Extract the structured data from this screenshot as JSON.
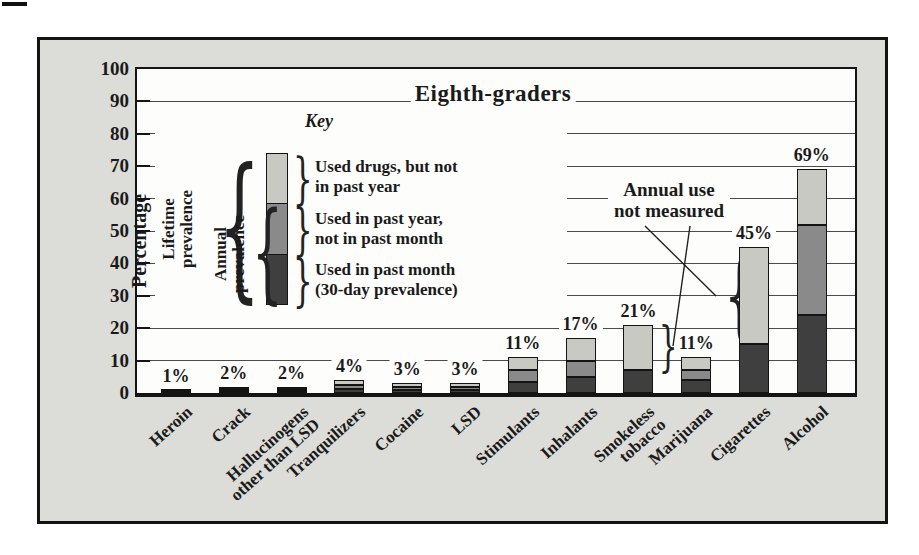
{
  "figure": {
    "title": "Eighth-graders",
    "y_axis_title": "Percentage",
    "key": {
      "heading": "Key",
      "items": [
        {
          "id": "lifetime-only",
          "label": "Used drugs, but not\nin past year",
          "color": "#c9c9c4"
        },
        {
          "id": "annual-only",
          "label": "Used in past year,\nnot in past month",
          "color": "#8a8a8a"
        },
        {
          "id": "past-month",
          "label": "Used in past month\n(30-day prevalence)",
          "color": "#3f3f3f"
        }
      ],
      "brackets": [
        {
          "id": "lifetime-prevalence",
          "label": "Lifetime\nprevalence"
        },
        {
          "id": "annual-prevalence",
          "label": "Annual\nprevalence"
        }
      ]
    },
    "annotation": "Annual use\nnot measured"
  },
  "chart_data": {
    "type": "bar",
    "stacked": true,
    "title": "Eighth-graders",
    "ylabel": "Percentage",
    "ylim": [
      0,
      100
    ],
    "ytick_interval": 10,
    "grid": true,
    "categories": [
      "Heroin",
      "Crack",
      "Hallucinogens\nother than LSD",
      "Tranquilizers",
      "Cocaine",
      "LSD",
      "Stimulants",
      "Inhalants",
      "Smokeless\ntobacco",
      "Marijuana",
      "Cigarettes",
      "Alcohol"
    ],
    "value_labels": [
      "1%",
      "2%",
      "2%",
      "4%",
      "3%",
      "3%",
      "11%",
      "17%",
      "21%",
      "11%",
      "45%",
      "69%"
    ],
    "totals": [
      1,
      2,
      2,
      4,
      3,
      3,
      11,
      17,
      21,
      11,
      45,
      69
    ],
    "series": [
      {
        "name": "Used in past month (30-day prevalence)",
        "values": [
          0.4,
          0.6,
          0.6,
          1.2,
          0.9,
          0.9,
          3.5,
          5,
          7,
          4,
          15,
          24
        ]
      },
      {
        "name": "Used in past year, not in past month",
        "values": [
          0.3,
          0.6,
          0.6,
          1.2,
          0.9,
          0.9,
          3.5,
          5,
          null,
          3,
          null,
          28
        ]
      },
      {
        "name": "Used drugs, but not in past year",
        "values": [
          0.3,
          0.8,
          0.8,
          1.6,
          1.2,
          1.2,
          4,
          7,
          14,
          4,
          30,
          17
        ]
      }
    ],
    "annual_not_measured": [
      "Smokeless tobacco",
      "Cigarettes"
    ],
    "legend_position": "upper left inside plot"
  }
}
